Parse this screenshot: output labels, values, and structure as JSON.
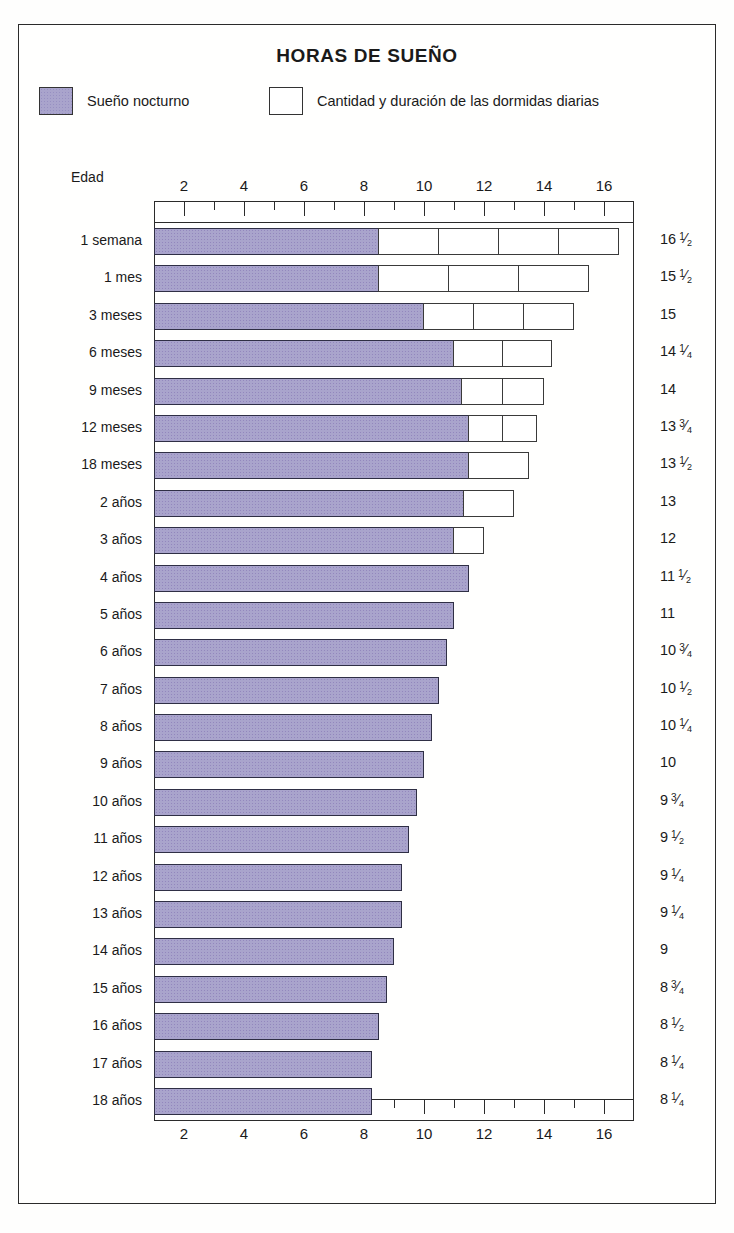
{
  "title": "HORAS DE SUEÑO",
  "legend": [
    {
      "key": "night",
      "label": "Sueño nocturno",
      "swatch": "filled-purple"
    },
    {
      "key": "naps",
      "label": "Cantidad y duración de las dormidas diarias",
      "swatch": "empty-white"
    }
  ],
  "axis_caption": "Edad",
  "chart_data": {
    "type": "bar",
    "orientation": "horizontal",
    "stacked": true,
    "title": "HORAS DE SUEÑO",
    "xlabel": "",
    "ylabel": "Edad",
    "xlim": [
      0,
      17
    ],
    "xticks": [
      2,
      4,
      6,
      8,
      10,
      12,
      14,
      16
    ],
    "minor_tick_step": 1,
    "grid": false,
    "legend_position": "top",
    "units": "horas",
    "series": [
      {
        "name": "Sueño nocturno",
        "color": "#a9a4cc"
      },
      {
        "name": "Cantidad y duración de las dormidas diarias",
        "color": "#ffffff"
      }
    ],
    "categories": [
      "1 semana",
      "1 mes",
      "3 meses",
      "6 meses",
      "9 meses",
      "12 meses",
      "18 meses",
      "2 años",
      "3 años",
      "4 años",
      "5 años",
      "6 años",
      "7 años",
      "8 años",
      "9 años",
      "10 años",
      "11 años",
      "12 años",
      "13 años",
      "14 años",
      "15 años",
      "16 años",
      "17 años",
      "18 años"
    ],
    "rows": [
      {
        "age": "1 semana",
        "night": 8.5,
        "naps": [
          2.0,
          2.0,
          2.0,
          2.0
        ],
        "total": 16.5,
        "total_label": "16",
        "total_frac": "1/2"
      },
      {
        "age": "1 mes",
        "night": 8.5,
        "naps": [
          2.333,
          2.333,
          2.334
        ],
        "total": 15.5,
        "total_label": "15",
        "total_frac": "1/2"
      },
      {
        "age": "3 meses",
        "night": 10.0,
        "naps": [
          1.667,
          1.667,
          1.666
        ],
        "total": 15.0,
        "total_label": "15",
        "total_frac": ""
      },
      {
        "age": "6 meses",
        "night": 11.0,
        "naps": [
          1.625,
          1.625
        ],
        "total": 14.25,
        "total_label": "14",
        "total_frac": "1/4"
      },
      {
        "age": "9 meses",
        "night": 11.25,
        "naps": [
          1.375,
          1.375
        ],
        "total": 14.0,
        "total_label": "14",
        "total_frac": ""
      },
      {
        "age": "12 meses",
        "night": 11.5,
        "naps": [
          1.125,
          1.125
        ],
        "total": 13.75,
        "total_label": "13",
        "total_frac": "3/4"
      },
      {
        "age": "18 meses",
        "night": 11.5,
        "naps": [
          2.0
        ],
        "total": 13.5,
        "total_label": "13",
        "total_frac": "1/2"
      },
      {
        "age": "2 años",
        "night": 11.33,
        "naps": [
          1.67
        ],
        "total": 13.0,
        "total_label": "13",
        "total_frac": ""
      },
      {
        "age": "3 años",
        "night": 11.0,
        "naps": [
          1.0
        ],
        "total": 12.0,
        "total_label": "12",
        "total_frac": ""
      },
      {
        "age": "4 años",
        "night": 11.5,
        "naps": [],
        "total": 11.5,
        "total_label": "11",
        "total_frac": "1/2"
      },
      {
        "age": "5 años",
        "night": 11.0,
        "naps": [],
        "total": 11.0,
        "total_label": "11",
        "total_frac": ""
      },
      {
        "age": "6 años",
        "night": 10.75,
        "naps": [],
        "total": 10.75,
        "total_label": "10",
        "total_frac": "3/4"
      },
      {
        "age": "7 años",
        "night": 10.5,
        "naps": [],
        "total": 10.5,
        "total_label": "10",
        "total_frac": "1/2"
      },
      {
        "age": "8 años",
        "night": 10.25,
        "naps": [],
        "total": 10.25,
        "total_label": "10",
        "total_frac": "1/4"
      },
      {
        "age": "9 años",
        "night": 10.0,
        "naps": [],
        "total": 10.0,
        "total_label": "10",
        "total_frac": ""
      },
      {
        "age": "10 años",
        "night": 9.75,
        "naps": [],
        "total": 9.75,
        "total_label": "9",
        "total_frac": "3/4"
      },
      {
        "age": "11 años",
        "night": 9.5,
        "naps": [],
        "total": 9.5,
        "total_label": "9",
        "total_frac": "1/2"
      },
      {
        "age": "12 años",
        "night": 9.25,
        "naps": [],
        "total": 9.25,
        "total_label": "9",
        "total_frac": "1/4"
      },
      {
        "age": "13 años",
        "night": 9.25,
        "naps": [],
        "total": 9.25,
        "total_label": "9",
        "total_frac": "1/4"
      },
      {
        "age": "14 años",
        "night": 9.0,
        "naps": [],
        "total": 9.0,
        "total_label": "9",
        "total_frac": ""
      },
      {
        "age": "15 años",
        "night": 8.75,
        "naps": [],
        "total": 8.75,
        "total_label": "8",
        "total_frac": "3/4"
      },
      {
        "age": "16 años",
        "night": 8.5,
        "naps": [],
        "total": 8.5,
        "total_label": "8",
        "total_frac": "1/2"
      },
      {
        "age": "17 años",
        "night": 8.25,
        "naps": [],
        "total": 8.25,
        "total_label": "8",
        "total_frac": "1/4"
      },
      {
        "age": "18 años",
        "night": 8.25,
        "naps": [],
        "total": 8.25,
        "total_label": "8",
        "total_frac": "1/4"
      }
    ]
  },
  "colors": {
    "night_fill": "#a9a4cc",
    "nap_fill": "#ffffff",
    "stroke": "#2b2b2b",
    "background": "#fffffe"
  }
}
